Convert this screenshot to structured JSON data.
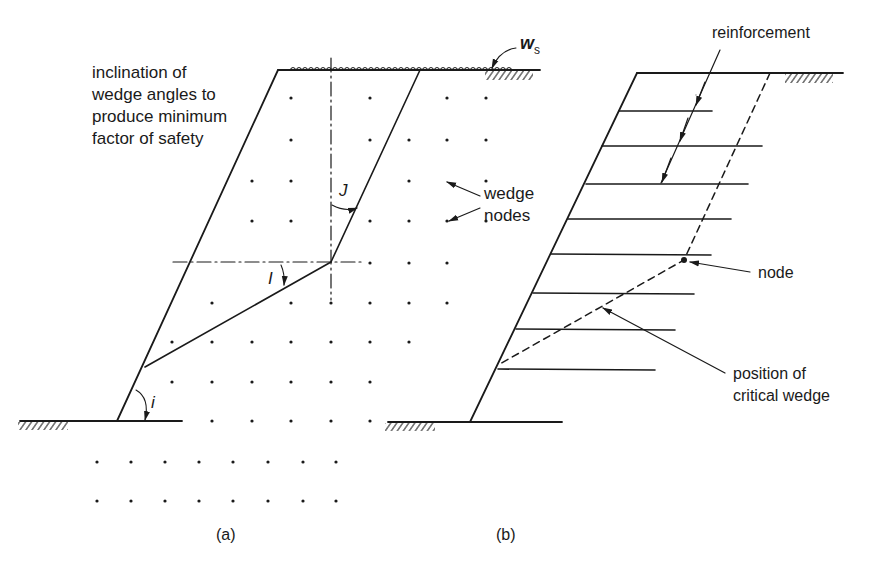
{
  "figure": {
    "panel_a": {
      "caption": "(a)",
      "annotation_lines": [
        "inclination of",
        "wedge angles to",
        "produce minimum",
        "factor of safety"
      ],
      "surcharge_label": "w",
      "surcharge_subscript": "s",
      "angle_labels": {
        "J": "J",
        "I": "I",
        "i": "i"
      },
      "nodes_label_lines": [
        "wedge",
        "nodes"
      ]
    },
    "panel_b": {
      "caption": "(b)",
      "reinforcement_label": "reinforcement",
      "node_label": "node",
      "critical_wedge_label_lines": [
        "position of",
        "critical wedge"
      ]
    },
    "colors": {
      "ink": "#1a1a1a",
      "background": "#ffffff"
    }
  }
}
